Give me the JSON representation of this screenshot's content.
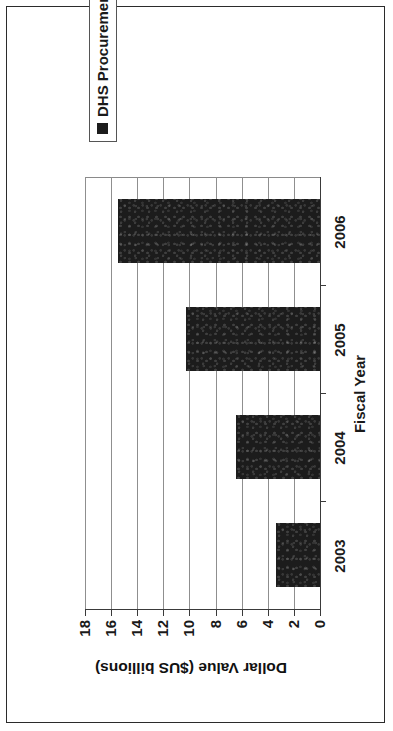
{
  "chart_data": {
    "type": "bar",
    "title": "",
    "orientation": "vertical",
    "categories": [
      "2003",
      "2004",
      "2005",
      "2006"
    ],
    "series": [
      {
        "name": "DHS Procurements",
        "values": [
          3.4,
          6.4,
          10.3,
          15.5
        ],
        "color": "#1c1c1c"
      }
    ],
    "xlabel": "Fiscal Year",
    "ylabel": "Dollar Value ($US billions)",
    "ylim": [
      0,
      18
    ],
    "ytick_labels": [
      "0",
      "2",
      "4",
      "6",
      "8",
      "10",
      "12",
      "14",
      "16",
      "18"
    ],
    "ytick_values": [
      0,
      2,
      4,
      6,
      8,
      10,
      12,
      14,
      16,
      18
    ],
    "grid": "horizontal",
    "legend_position": "right",
    "page_rotation_degrees": -90
  },
  "legend": {
    "entries": [
      {
        "label": "DHS Procurements",
        "swatch_color": "#1c1c1c"
      }
    ]
  },
  "axes": {
    "x_title": "Fiscal Year",
    "y_title": "Dollar Value ($US billions)"
  },
  "colors": {
    "bar": "#1c1c1c",
    "axis": "#3a3a3a",
    "grid": "#8f8f8f",
    "page_border": "#2b2b2b",
    "text": "#1a1a1a",
    "background": "#ffffff"
  }
}
